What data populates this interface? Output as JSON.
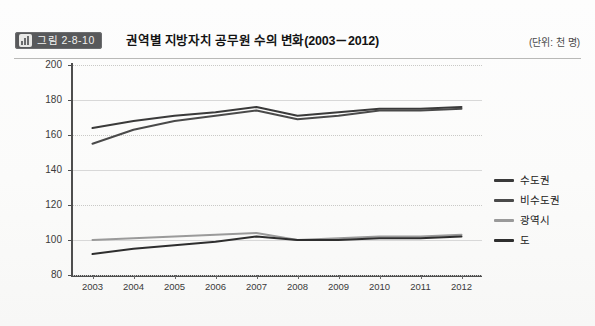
{
  "header": {
    "badge_label": "그림 2-8-10",
    "badge_icon": "bar-chart-icon",
    "badge_color": "#58595b",
    "title": "권역별 지방자치 공무원 수의 변화(2003－2012)",
    "unit_note": "(단위: 천 명)"
  },
  "chart_data": {
    "type": "line",
    "title": "권역별 지방자치 공무원 수의 변화(2003－2012)",
    "xlabel": "",
    "ylabel": "",
    "unit": "천 명",
    "categories": [
      "2003",
      "2004",
      "2005",
      "2006",
      "2007",
      "2008",
      "2009",
      "2010",
      "2011",
      "2012"
    ],
    "ylim": [
      80,
      200
    ],
    "ytick_values": [
      80,
      100,
      120,
      140,
      160,
      180,
      200
    ],
    "ytick_labels": [
      "80",
      "100",
      "120",
      "140",
      "160",
      "180",
      "200"
    ],
    "grid": true,
    "legend_position": "right",
    "series": [
      {
        "name": "수도권",
        "color": "#3a3a3a",
        "width": 2.0,
        "values": [
          164,
          168,
          171,
          173,
          176,
          171,
          173,
          175,
          175,
          176
        ]
      },
      {
        "name": "비수도권",
        "color": "#4a4a4a",
        "width": 2.0,
        "values": [
          155,
          163,
          168,
          171,
          174,
          169,
          171,
          174,
          174,
          175
        ]
      },
      {
        "name": "광역시",
        "color": "#9a9a9a",
        "width": 2.0,
        "values": [
          100,
          101,
          102,
          103,
          104,
          100,
          101,
          102,
          102,
          103
        ]
      },
      {
        "name": "도",
        "color": "#2e2e2e",
        "width": 2.0,
        "values": [
          92,
          95,
          97,
          99,
          102,
          100,
          100,
          101,
          101,
          102
        ]
      }
    ]
  },
  "legend": {
    "items": [
      {
        "label": "수도권",
        "color": "#3a3a3a"
      },
      {
        "label": "비수도권",
        "color": "#4a4a4a"
      },
      {
        "label": "광역시",
        "color": "#9a9a9a"
      },
      {
        "label": "도",
        "color": "#2e2e2e"
      }
    ]
  }
}
